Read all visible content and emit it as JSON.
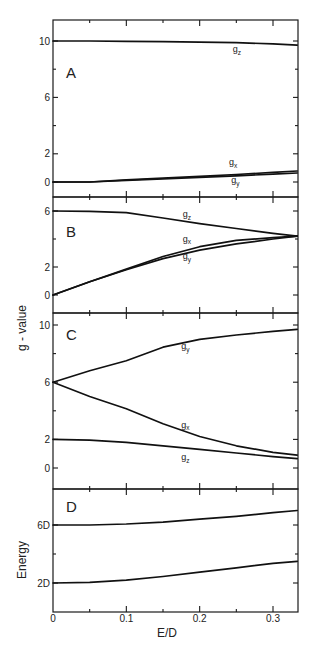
{
  "chart_data": [
    {
      "type": "line",
      "panel": "A",
      "title": "",
      "xlabel": "E/D",
      "ylabel": "g - value",
      "xlim": [
        0,
        0.333
      ],
      "ylim": [
        -1.1,
        11.5
      ],
      "yticks": [
        0,
        2,
        6,
        10
      ],
      "yticks_minor": [
        4,
        8
      ],
      "grid": false,
      "x": [
        0,
        0.05,
        0.1,
        0.15,
        0.2,
        0.25,
        0.3,
        0.333
      ],
      "series": [
        {
          "name": "gz",
          "values": [
            10.0,
            10.0,
            9.97,
            9.95,
            9.92,
            9.88,
            9.8,
            9.7
          ]
        },
        {
          "name": "gx",
          "values": [
            0.0,
            0.0,
            0.15,
            0.27,
            0.4,
            0.53,
            0.68,
            0.78
          ]
        },
        {
          "name": "gy",
          "values": [
            0.0,
            0.0,
            0.12,
            0.22,
            0.33,
            0.44,
            0.56,
            0.64
          ]
        }
      ],
      "labels": [
        {
          "text": "g",
          "sub": "z",
          "x": 0.245,
          "y": 9.2
        },
        {
          "text": "g",
          "sub": "x",
          "x": 0.24,
          "y": 1.2
        },
        {
          "text": "g",
          "sub": "y",
          "x": 0.243,
          "y": -0.1
        }
      ]
    },
    {
      "type": "line",
      "panel": "B",
      "xlabel": "E/D",
      "ylabel": "g - value",
      "xlim": [
        0,
        0.333
      ],
      "ylim": [
        -1.3,
        7.0
      ],
      "yticks": [
        0,
        2,
        6
      ],
      "yticks_minor": [
        4
      ],
      "grid": false,
      "x": [
        0,
        0.05,
        0.1,
        0.15,
        0.2,
        0.25,
        0.3,
        0.333
      ],
      "series": [
        {
          "name": "gz",
          "values": [
            6.0,
            5.97,
            5.88,
            5.5,
            5.1,
            4.75,
            4.4,
            4.2
          ]
        },
        {
          "name": "gx",
          "values": [
            0.0,
            0.95,
            1.85,
            2.75,
            3.45,
            3.9,
            4.1,
            4.2
          ]
        },
        {
          "name": "gy",
          "values": [
            0.0,
            0.95,
            1.8,
            2.6,
            3.2,
            3.65,
            4.0,
            4.2
          ]
        }
      ],
      "labels": [
        {
          "text": "g",
          "sub": "z",
          "x": 0.177,
          "y": 5.55
        },
        {
          "text": "g",
          "sub": "x",
          "x": 0.177,
          "y": 3.8
        },
        {
          "text": "g",
          "sub": "y",
          "x": 0.177,
          "y": 2.55
        }
      ]
    },
    {
      "type": "line",
      "panel": "C",
      "xlabel": "E/D",
      "ylabel": "g - value",
      "xlim": [
        0,
        0.333
      ],
      "ylim": [
        -1.5,
        10.8
      ],
      "yticks": [
        0,
        2,
        6,
        10
      ],
      "yticks_minor": [
        4,
        8
      ],
      "grid": false,
      "x": [
        0,
        0.05,
        0.1,
        0.15,
        0.2,
        0.25,
        0.3,
        0.333
      ],
      "series": [
        {
          "name": "gy",
          "values": [
            6.0,
            6.8,
            7.5,
            8.45,
            9.0,
            9.3,
            9.55,
            9.7
          ]
        },
        {
          "name": "gx",
          "values": [
            6.0,
            5.0,
            4.15,
            3.1,
            2.2,
            1.55,
            1.1,
            0.9
          ]
        },
        {
          "name": "gz",
          "values": [
            2.0,
            1.95,
            1.8,
            1.55,
            1.3,
            1.05,
            0.8,
            0.65
          ]
        }
      ],
      "labels": [
        {
          "text": "g",
          "sub": "y",
          "x": 0.175,
          "y": 8.3
        },
        {
          "text": "g",
          "sub": "x",
          "x": 0.175,
          "y": 2.8
        },
        {
          "text": "g",
          "sub": "z",
          "x": 0.175,
          "y": 0.55
        }
      ]
    },
    {
      "type": "line",
      "panel": "D",
      "xlabel": "E/D",
      "ylabel": "Energy",
      "xlim": [
        0,
        0.333
      ],
      "ylim": [
        0,
        8.5
      ],
      "yticks": [
        2,
        6
      ],
      "ytick_labels": [
        "2D",
        "6D"
      ],
      "yticks_minor": [
        4
      ],
      "xticks": [
        0,
        0.1,
        0.2,
        0.3
      ],
      "xtick_labels": [
        "0",
        "0.1",
        "0.2",
        "0.3"
      ],
      "grid": false,
      "x": [
        0,
        0.05,
        0.1,
        0.15,
        0.2,
        0.25,
        0.3,
        0.333
      ],
      "series": [
        {
          "name": "upper level",
          "values": [
            6.0,
            6.0,
            6.07,
            6.2,
            6.4,
            6.6,
            6.85,
            7.0
          ]
        },
        {
          "name": "lower level",
          "values": [
            2.0,
            2.05,
            2.2,
            2.45,
            2.75,
            3.05,
            3.35,
            3.5
          ]
        }
      ],
      "labels": []
    }
  ],
  "figure": {
    "panels": [
      "A",
      "B",
      "C",
      "D"
    ],
    "x_axis_title": "E/D",
    "y_axis_title_upper": "g - value",
    "y_axis_title_lower": "Energy",
    "xtick_labels": [
      "0",
      "0.1",
      "0.2",
      "0.3"
    ]
  }
}
